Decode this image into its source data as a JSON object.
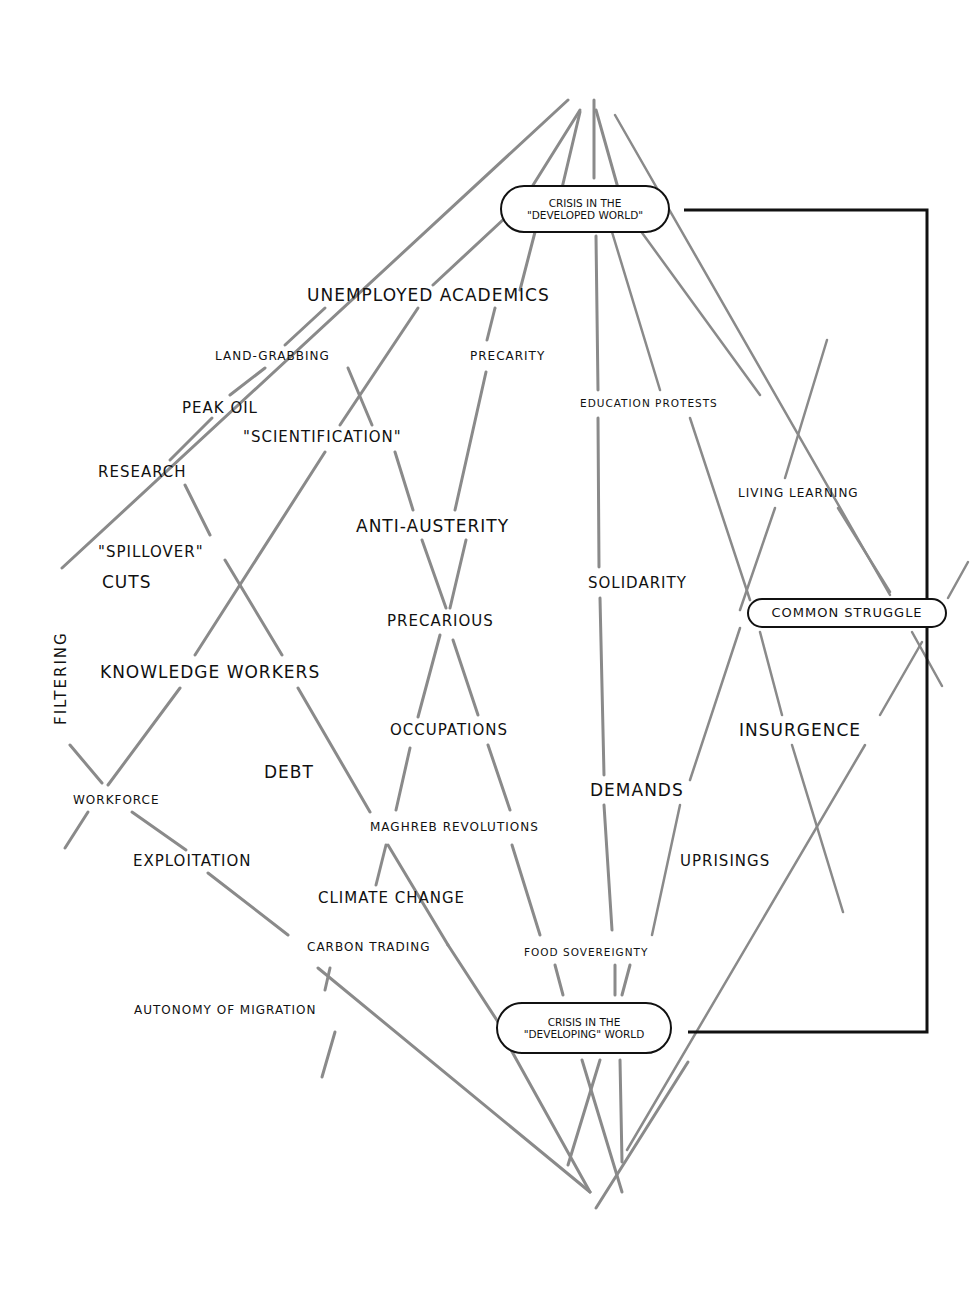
{
  "diagram": {
    "type": "hand-drawn concept map",
    "line_color": "#8a8a8a",
    "ink_color": "#111111",
    "background": "#ffffff",
    "highlighted_nodes": {
      "crisis_developed": {
        "line1": "Crisis in the",
        "line2": "\"Developed World\""
      },
      "crisis_developing": {
        "line1": "Crisis in the",
        "line2": "\"Developing\" World"
      },
      "common_struggle": "Common Struggle"
    },
    "nodes": {
      "unemployed_academics": "Unemployed Academics",
      "land_grabbing": "Land-Grabbing",
      "precarity": "Precarity",
      "peak_oil": "Peak Oil",
      "scientification": "\"Scientification\"",
      "education_protests": "Education Protests",
      "research": "Research",
      "living_learning": "Living Learning",
      "anti_austerity": "Anti-Austerity",
      "spillover": "\"Spillover\"",
      "cuts": "Cuts",
      "solidarity": "Solidarity",
      "filtering": "Filtering",
      "precarious": "Precarious",
      "knowledge_workers": "Knowledge Workers",
      "occupations": "Occupations",
      "insurgence": "Insurgence",
      "debt": "Debt",
      "demands": "Demands",
      "workforce": "Workforce",
      "maghreb_revolutions": "Maghreb Revolutions",
      "exploitation": "Exploitation",
      "uprisings": "Uprisings",
      "climate_change": "Climate Change",
      "carbon_trading": "Carbon Trading",
      "food_sovereignty": "Food Sovereignty",
      "autonomy_of_migration": "Autonomy of Migration"
    },
    "connections": [
      {
        "from": "crisis_developed",
        "to": "crisis_developing",
        "style": "black bracket line on right side"
      }
    ]
  }
}
